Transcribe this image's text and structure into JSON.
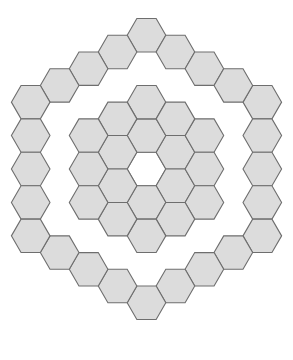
{
  "figure": {
    "type": "hex-grid",
    "orientation": "flat-top",
    "background_color": "#ffffff",
    "canvas": {
      "width": 293,
      "height": 360
    }
  },
  "geometry": {
    "center_x": 146.5,
    "center_y": 169,
    "hex_radius": 19.3,
    "column_pitch": 28.95,
    "row_pitch": 33.43,
    "stroke_width": 1.1
  },
  "style": {
    "fill_color": "#dcdcdc",
    "stroke_color": "#6e6e6e",
    "empty_fill_color": "#ffffff",
    "empty_stroke_color": "#6e6e6e"
  },
  "chart_data": {
    "type": "heatmap",
    "xlabel": "",
    "ylabel": "",
    "coordinate_system": "axial (q, r) flat-top",
    "rings_filled": [
      1,
      2,
      4
    ],
    "rings_empty": [
      0,
      3
    ],
    "ring_counts": {
      "0": 1,
      "1": 6,
      "2": 12,
      "3": 18,
      "4": 24
    },
    "filled_count": 42,
    "empty_count": 1,
    "total_drawn": 43,
    "legend": [
      {
        "label": "filled hexagon",
        "color": "#dcdcdc"
      },
      {
        "label": "empty hexagon",
        "color": "#ffffff"
      }
    ],
    "cells": [
      {
        "q": 0,
        "r": 0,
        "ring": 0,
        "state": "empty"
      },
      {
        "q": 1,
        "r": -1,
        "ring": 1,
        "state": "filled"
      },
      {
        "q": 1,
        "r": 0,
        "ring": 1,
        "state": "filled"
      },
      {
        "q": 0,
        "r": 1,
        "ring": 1,
        "state": "filled"
      },
      {
        "q": -1,
        "r": 1,
        "ring": 1,
        "state": "filled"
      },
      {
        "q": -1,
        "r": 0,
        "ring": 1,
        "state": "filled"
      },
      {
        "q": 0,
        "r": -1,
        "ring": 1,
        "state": "filled"
      },
      {
        "q": 2,
        "r": -2,
        "ring": 2,
        "state": "filled"
      },
      {
        "q": 2,
        "r": -1,
        "ring": 2,
        "state": "filled"
      },
      {
        "q": 2,
        "r": 0,
        "ring": 2,
        "state": "filled"
      },
      {
        "q": 1,
        "r": 1,
        "ring": 2,
        "state": "filled"
      },
      {
        "q": 0,
        "r": 2,
        "ring": 2,
        "state": "filled"
      },
      {
        "q": -1,
        "r": 2,
        "ring": 2,
        "state": "filled"
      },
      {
        "q": -2,
        "r": 2,
        "ring": 2,
        "state": "filled"
      },
      {
        "q": -2,
        "r": 1,
        "ring": 2,
        "state": "filled"
      },
      {
        "q": -2,
        "r": 0,
        "ring": 2,
        "state": "filled"
      },
      {
        "q": -1,
        "r": -1,
        "ring": 2,
        "state": "filled"
      },
      {
        "q": 0,
        "r": -2,
        "ring": 2,
        "state": "filled"
      },
      {
        "q": 1,
        "r": -2,
        "ring": 2,
        "state": "filled"
      },
      {
        "q": 4,
        "r": -4,
        "ring": 4,
        "state": "filled"
      },
      {
        "q": 4,
        "r": -3,
        "ring": 4,
        "state": "filled"
      },
      {
        "q": 4,
        "r": -2,
        "ring": 4,
        "state": "filled"
      },
      {
        "q": 4,
        "r": -1,
        "ring": 4,
        "state": "filled"
      },
      {
        "q": 4,
        "r": 0,
        "ring": 4,
        "state": "filled"
      },
      {
        "q": 3,
        "r": 1,
        "ring": 4,
        "state": "filled"
      },
      {
        "q": 2,
        "r": 2,
        "ring": 4,
        "state": "filled"
      },
      {
        "q": 1,
        "r": 3,
        "ring": 4,
        "state": "filled"
      },
      {
        "q": 0,
        "r": 4,
        "ring": 4,
        "state": "filled"
      },
      {
        "q": -1,
        "r": 4,
        "ring": 4,
        "state": "filled"
      },
      {
        "q": -2,
        "r": 4,
        "ring": 4,
        "state": "filled"
      },
      {
        "q": -3,
        "r": 4,
        "ring": 4,
        "state": "filled"
      },
      {
        "q": -4,
        "r": 4,
        "ring": 4,
        "state": "filled"
      },
      {
        "q": -4,
        "r": 3,
        "ring": 4,
        "state": "filled"
      },
      {
        "q": -4,
        "r": 2,
        "ring": 4,
        "state": "filled"
      },
      {
        "q": -4,
        "r": 1,
        "ring": 4,
        "state": "filled"
      },
      {
        "q": -4,
        "r": 0,
        "ring": 4,
        "state": "filled"
      },
      {
        "q": -3,
        "r": -1,
        "ring": 4,
        "state": "filled"
      },
      {
        "q": -2,
        "r": -2,
        "ring": 4,
        "state": "filled"
      },
      {
        "q": -1,
        "r": -3,
        "ring": 4,
        "state": "filled"
      },
      {
        "q": 0,
        "r": -4,
        "ring": 4,
        "state": "filled"
      },
      {
        "q": 1,
        "r": -4,
        "ring": 4,
        "state": "filled"
      },
      {
        "q": 2,
        "r": -4,
        "ring": 4,
        "state": "filled"
      },
      {
        "q": 3,
        "r": -4,
        "ring": 4,
        "state": "filled"
      }
    ]
  }
}
